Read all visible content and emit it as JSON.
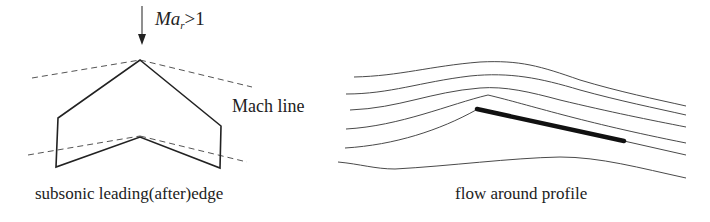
{
  "left_figure": {
    "freestream_label": {
      "prefix": "Ma",
      "subscript": "r",
      "relation": ">1"
    },
    "mach_line_label": "Mach line",
    "caption": "subsonic leading(after)edge"
  },
  "right_figure": {
    "caption": "flow around profile",
    "streamline_count": 6
  },
  "colors": {
    "stroke": "#222222",
    "dashed": "#555555",
    "streamline": "#4a4a4a",
    "plate": "#111111"
  }
}
